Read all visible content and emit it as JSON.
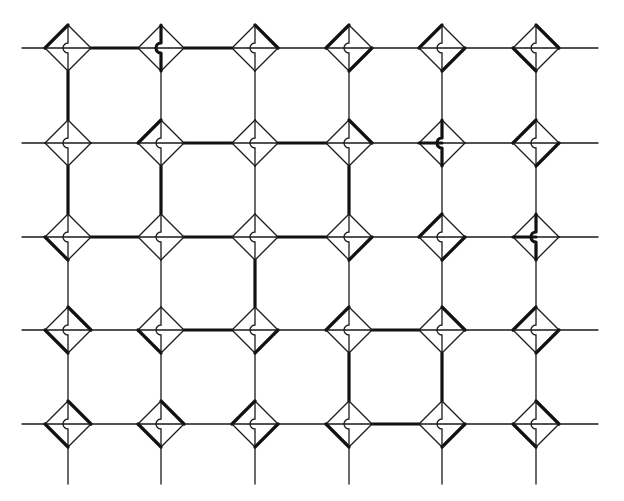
{
  "diagram": {
    "title": "",
    "colors": {
      "background": "#ffffff",
      "line": "#1a1a1a",
      "thick": "#111111"
    },
    "grid": {
      "cols_x": [
        68,
        161,
        255,
        349,
        442,
        536
      ],
      "rows_y": [
        48,
        143,
        237,
        330,
        424
      ],
      "h_line_extent": [
        22,
        598
      ],
      "v_line_extent_bottom": 484,
      "node_half_size": 23
    },
    "nodes": [
      {
        "col": 0,
        "row": 0,
        "thick_edges": [
          "TL"
        ],
        "thick_center": []
      },
      {
        "col": 1,
        "row": 0,
        "thick_edges": [],
        "thick_center": [
          "V"
        ]
      },
      {
        "col": 2,
        "row": 0,
        "thick_edges": [
          "TR"
        ],
        "thick_center": []
      },
      {
        "col": 3,
        "row": 0,
        "thick_edges": [
          "TL",
          "BR"
        ],
        "thick_center": []
      },
      {
        "col": 4,
        "row": 0,
        "thick_edges": [
          "TL",
          "BR"
        ],
        "thick_center": []
      },
      {
        "col": 5,
        "row": 0,
        "thick_edges": [
          "TR",
          "BL"
        ],
        "thick_center": []
      },
      {
        "col": 0,
        "row": 1,
        "thick_edges": [],
        "thick_center": []
      },
      {
        "col": 1,
        "row": 1,
        "thick_edges": [
          "TL"
        ],
        "thick_center": []
      },
      {
        "col": 2,
        "row": 1,
        "thick_edges": [],
        "thick_center": []
      },
      {
        "col": 3,
        "row": 1,
        "thick_edges": [
          "TR"
        ],
        "thick_center": []
      },
      {
        "col": 4,
        "row": 1,
        "thick_edges": [],
        "thick_center": [
          "V",
          "HL"
        ]
      },
      {
        "col": 5,
        "row": 1,
        "thick_edges": [
          "TL",
          "BR"
        ],
        "thick_center": []
      },
      {
        "col": 0,
        "row": 2,
        "thick_edges": [
          "BL"
        ],
        "thick_center": []
      },
      {
        "col": 1,
        "row": 2,
        "thick_edges": [],
        "thick_center": []
      },
      {
        "col": 2,
        "row": 2,
        "thick_edges": [],
        "thick_center": []
      },
      {
        "col": 3,
        "row": 2,
        "thick_edges": [
          "BR"
        ],
        "thick_center": []
      },
      {
        "col": 4,
        "row": 2,
        "thick_edges": [
          "TL",
          "BR"
        ],
        "thick_center": []
      },
      {
        "col": 5,
        "row": 2,
        "thick_edges": [],
        "thick_center": [
          "V",
          "HL"
        ]
      },
      {
        "col": 0,
        "row": 3,
        "thick_edges": [
          "TR",
          "BL"
        ],
        "thick_center": []
      },
      {
        "col": 1,
        "row": 3,
        "thick_edges": [
          "BL"
        ],
        "thick_center": []
      },
      {
        "col": 2,
        "row": 3,
        "thick_edges": [
          "BR"
        ],
        "thick_center": []
      },
      {
        "col": 3,
        "row": 3,
        "thick_edges": [
          "TL"
        ],
        "thick_center": []
      },
      {
        "col": 4,
        "row": 3,
        "thick_edges": [
          "TR"
        ],
        "thick_center": []
      },
      {
        "col": 5,
        "row": 3,
        "thick_edges": [
          "TL",
          "BR"
        ],
        "thick_center": []
      },
      {
        "col": 0,
        "row": 4,
        "thick_edges": [
          "TR",
          "BL"
        ],
        "thick_center": []
      },
      {
        "col": 1,
        "row": 4,
        "thick_edges": [
          "TR",
          "BL"
        ],
        "thick_center": []
      },
      {
        "col": 2,
        "row": 4,
        "thick_edges": [
          "TL",
          "BR"
        ],
        "thick_center": []
      },
      {
        "col": 3,
        "row": 4,
        "thick_edges": [
          "BL"
        ],
        "thick_center": []
      },
      {
        "col": 4,
        "row": 4,
        "thick_edges": [
          "BR"
        ],
        "thick_center": []
      },
      {
        "col": 5,
        "row": 4,
        "thick_edges": [
          "TR",
          "BL"
        ],
        "thick_center": []
      }
    ],
    "thick_h_links": [
      {
        "row": 0,
        "from_col": 0
      },
      {
        "row": 0,
        "from_col": 1
      },
      {
        "row": 1,
        "from_col": 1
      },
      {
        "row": 1,
        "from_col": 2
      },
      {
        "row": 2,
        "from_col": 0
      },
      {
        "row": 2,
        "from_col": 1
      },
      {
        "row": 2,
        "from_col": 2
      },
      {
        "row": 3,
        "from_col": 1
      },
      {
        "row": 3,
        "from_col": 3
      },
      {
        "row": 4,
        "from_col": 3
      }
    ],
    "thick_v_links": [
      {
        "col": 0,
        "from_row": 0
      },
      {
        "col": 0,
        "from_row": 1
      },
      {
        "col": 1,
        "from_row": 1
      },
      {
        "col": 2,
        "from_row": 2
      },
      {
        "col": 3,
        "from_row": 1
      },
      {
        "col": 3,
        "from_row": 3
      },
      {
        "col": 4,
        "from_row": 3
      }
    ]
  }
}
